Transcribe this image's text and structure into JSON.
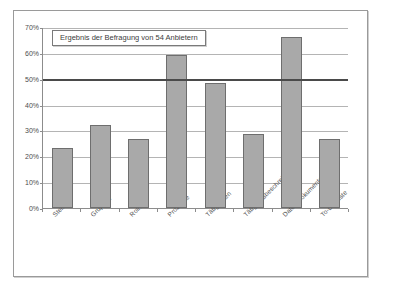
{
  "chart_data": {
    "type": "bar",
    "title": "Ergebnis der Befragung von 54 Anbietern",
    "xlabel": "",
    "ylabel": "",
    "categories": [
      "Stellen",
      "Gruppen",
      "Rollen",
      "Prozesse",
      "Tätigkeiten",
      "Tätigkeitsbeschreibungen",
      "Daten/Dokumente",
      "To-Do-Liste"
    ],
    "values": [
      23.2,
      32.2,
      26.8,
      59.0,
      48.5,
      28.5,
      66.0,
      26.5
    ],
    "ylim": [
      0,
      70
    ],
    "ytick_labels": [
      "70%",
      "60%",
      "50%",
      "40%",
      "30%",
      "20%",
      "10%",
      "0%"
    ],
    "ytick_values": [
      70,
      60,
      50,
      40,
      30,
      20,
      10,
      0
    ],
    "grid": true,
    "legend": "none",
    "annotations": [
      {
        "name": "reference-line",
        "value": 50,
        "label": "50%",
        "style": "thick-dark-horizontal-line"
      }
    ],
    "series": [
      {
        "name": "Anteil der Anbieter",
        "values": [
          23.2,
          32.2,
          26.8,
          59.0,
          48.5,
          28.5,
          66.0,
          26.5
        ]
      }
    ],
    "colors": {
      "bar_fill": "#a9a9a9",
      "bar_border": "#6e6e6e",
      "gridline": "#b4b4b4",
      "axis": "#8c8c8c",
      "reference_line": "#4a4a4a",
      "text": "#4d4d4d",
      "background": "#ffffff",
      "frame": "#9a9a9a"
    }
  }
}
